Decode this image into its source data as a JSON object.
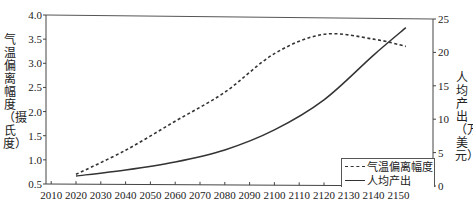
{
  "chart_data": {
    "type": "line",
    "title": "",
    "xlabel": "",
    "ylabel_left": "气温偏离幅度（摄氏度）",
    "ylabel_right": "人均产出（万美元）",
    "x_ticks": [
      "2010",
      "2020",
      "2030",
      "2040",
      "2050",
      "2060",
      "2070",
      "2080",
      "2090",
      "2100",
      "2110",
      "2120",
      "2130",
      "2140",
      "2150"
    ],
    "y_left_ticks": [
      "0.5",
      "1.0",
      "1.5",
      "2.0",
      "2.5",
      "3.0",
      "3.5",
      "4.0"
    ],
    "y_right_ticks": [
      "0",
      "5",
      "10",
      "15",
      "20",
      "25"
    ],
    "ylim_left": [
      0.5,
      4.0
    ],
    "ylim_right": [
      0,
      25
    ],
    "grid": false,
    "legend_position": "lower right",
    "x": [
      2020,
      2040,
      2060,
      2080,
      2100,
      2120,
      2140,
      2153
    ],
    "series": [
      {
        "name": "气温偏离幅度",
        "axis": "left",
        "style": "dashed",
        "values": [
          0.7,
          1.2,
          1.8,
          2.4,
          3.2,
          3.6,
          3.5,
          3.35
        ]
      },
      {
        "name": "人均产出",
        "axis": "right",
        "style": "solid",
        "values": [
          1.5,
          2.4,
          3.6,
          5.4,
          8.4,
          12.9,
          19.6,
          23.7
        ]
      }
    ]
  },
  "labels": {
    "left_axis_title": "气温偏离幅度（摄氏度）",
    "right_axis_title": "人均产出（万美元）",
    "legend_temp": "气温偏离幅度",
    "legend_output": "人均产出"
  }
}
